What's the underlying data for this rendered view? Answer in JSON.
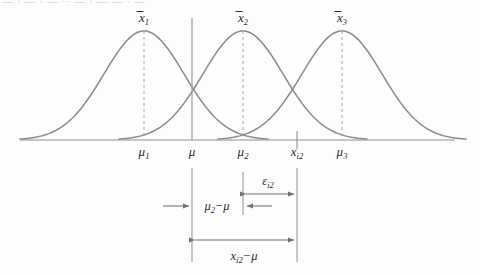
{
  "figure": {
    "type": "statistical-diagram",
    "clipped_header_text": "— · — · — ·· — · — — · —",
    "colors": {
      "curve": "#8a8a93",
      "axis": "#8f8f97",
      "dashed": "#a8a8b0",
      "guide": "#9a9aa2",
      "arrow": "#6f6f78",
      "text": "#2b2b2b",
      "background": "#fdfdfd"
    },
    "curves": [
      {
        "name": "distribution-1",
        "peak_label": "x̄1",
        "center_x": 144,
        "peak_y": 31,
        "half_width": 124
      },
      {
        "name": "distribution-2",
        "peak_label": "x̄2",
        "center_x": 243,
        "peak_y": 31,
        "half_width": 124
      },
      {
        "name": "distribution-3",
        "peak_label": "x̄3",
        "center_x": 342,
        "peak_y": 31,
        "half_width": 124
      }
    ],
    "peak_labels": [
      {
        "base": "x",
        "overbar": true,
        "sub": "1"
      },
      {
        "base": "x",
        "overbar": true,
        "sub": "2"
      },
      {
        "base": "x",
        "overbar": true,
        "sub": "3"
      }
    ],
    "axis": {
      "y": 140,
      "x_start": 20,
      "x_end": 455,
      "ticks": [
        {
          "name": "tick-mu-1",
          "x": 144,
          "base": "μ",
          "sub": "1",
          "has_mark": false
        },
        {
          "name": "tick-mu",
          "x": 192,
          "base": "μ",
          "sub": "",
          "has_mark": false
        },
        {
          "name": "tick-mu-2",
          "x": 243,
          "base": "μ",
          "sub": "2",
          "has_mark": false
        },
        {
          "name": "tick-x-i2",
          "x": 297,
          "base": "x",
          "sub": "i2",
          "has_mark": true
        },
        {
          "name": "tick-mu-3",
          "x": 342,
          "base": "μ",
          "sub": "3",
          "has_mark": false
        }
      ],
      "tick_label_y": 156
    },
    "guides": [
      {
        "name": "guide-mu",
        "x": 192,
        "y_top": 168,
        "y_bottom": 262
      },
      {
        "name": "guide-mu-2",
        "x": 243,
        "y_top": 172,
        "y_bottom": 215
      },
      {
        "name": "guide-x-i2",
        "x": 297,
        "y_top": 168,
        "y_bottom": 262
      }
    ],
    "annotations": [
      {
        "name": "epsilon-i2",
        "label_base": "ε",
        "label_sub": "i2",
        "label_x": 268,
        "label_y": 183,
        "arrow_y": 194,
        "arrow_x1": 243,
        "arrow_x2": 297,
        "style": "double-headed"
      },
      {
        "name": "mu2-minus-mu",
        "label_text": "μ₂−μ",
        "label_x": 217,
        "label_y": 210,
        "style": "inward-arrows",
        "left_arrow": {
          "from_x": 163,
          "to_x": 190,
          "y": 206
        },
        "right_arrow": {
          "from_x": 272,
          "to_x": 246,
          "y": 206
        }
      },
      {
        "name": "x-i2-minus-mu",
        "label_text": "xᵢ₂−μ",
        "label_x": 244,
        "label_y": 258,
        "arrow_y": 240,
        "arrow_x1": 192,
        "arrow_x2": 297,
        "style": "double-headed"
      }
    ],
    "annotation_labels": {
      "epsilon": {
        "base": "ε",
        "sub": "i2"
      },
      "mu_diff": {
        "base": "μ",
        "sub": "2",
        "tail": "−μ"
      },
      "x_diff": {
        "base": "x",
        "sub": "i2",
        "tail": "−μ"
      }
    }
  }
}
